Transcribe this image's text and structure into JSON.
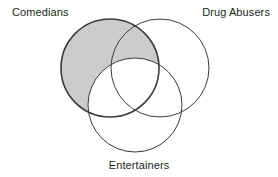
{
  "figure": {
    "type": "venn-diagram",
    "set_count": 3,
    "background_color": "#ffffff",
    "stroke_color": "#3b3b3b",
    "shaded_fill_color": "#cccccc",
    "label_color": "#231f20"
  },
  "labels": {
    "comedians": "Comedians",
    "drug_abusers": "Drug Abusers",
    "entertainers": "Entertainers"
  },
  "sets": [
    {
      "id": "comedians",
      "label": "Comedians",
      "position": "top-left",
      "cx": 110,
      "cy": 68,
      "r": 49,
      "fill": "#cccccc",
      "stroke_width": 1.6
    },
    {
      "id": "drug_abusers",
      "label": "Drug Abusers",
      "position": "top-right",
      "cx": 160,
      "cy": 68,
      "r": 49,
      "fill": "none",
      "stroke_width": 1
    },
    {
      "id": "entertainers",
      "label": "Entertainers",
      "position": "bottom-center",
      "cx": 135,
      "cy": 105,
      "r": 47,
      "fill": "none",
      "stroke_width": 1
    }
  ],
  "shading": {
    "description": "Comedians minus Entertainers",
    "included_regions": [
      "comedians-only",
      "comedians-and-drug-abusers-only"
    ],
    "excluded_regions": [
      "comedians-and-entertainers-only",
      "all-three",
      "drug-abusers-only",
      "drug-abusers-and-entertainers-only",
      "entertainers-only",
      "outside-all"
    ],
    "fill": "#cccccc"
  }
}
